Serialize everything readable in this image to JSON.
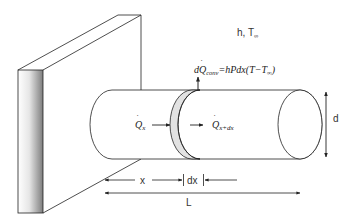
{
  "diagram": {
    "environment_label": {
      "h": "h,",
      "t": "T",
      "t_sub": "∞"
    },
    "convection_equation": {
      "lhs_d": "d",
      "lhs_q": "Q",
      "lhs_sub": "conv",
      "rhs": "=hPdx(T−T",
      "rhs_sub": "∞",
      "rhs_close": ")"
    },
    "heat_in": {
      "q": "Q",
      "sub": "x"
    },
    "heat_out": {
      "q": "Q",
      "sub": "x+dx"
    },
    "dimensions": {
      "diameter": "d",
      "position": "x",
      "element": "dx",
      "length": "L"
    },
    "colors": {
      "line": "#222222",
      "slice_fill": "#e2e2e2",
      "wall_gradient_dark": "#8a8a8a",
      "wall_gradient_light": "#ffffff"
    }
  }
}
